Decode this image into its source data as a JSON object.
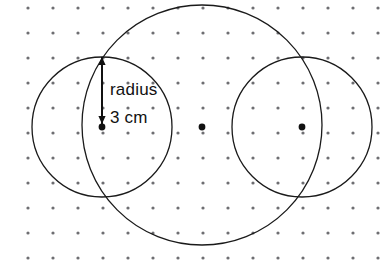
{
  "figure": {
    "background_color": "#ffffff",
    "width": 388,
    "height": 262,
    "annotations": {
      "radius_word": "radius",
      "radius_value": "3 cm"
    },
    "grid": {
      "dot_color": "#6e6e72",
      "dot_radius": 1.6,
      "spacing_x": 25,
      "spacing_y": 25,
      "origin_x": 28,
      "origin_y": 8,
      "cols": 15,
      "rows": 11
    },
    "stroke_color": "#1a1a1a",
    "center_dot_color": "#111111",
    "circles": [
      {
        "name": "large-circle",
        "cx": 202,
        "cy": 125,
        "r": 120,
        "has_center_dot": false
      },
      {
        "name": "left-circle",
        "cx": 102,
        "cy": 127,
        "r": 70,
        "has_center_dot": true
      },
      {
        "name": "right-circle",
        "cx": 302,
        "cy": 127,
        "r": 70,
        "has_center_dot": true
      }
    ],
    "center_dots": [
      {
        "name": "left-center-dot",
        "cx": 102,
        "cy": 127,
        "r": 3.4
      },
      {
        "name": "middle-center-dot",
        "cx": 202,
        "cy": 127,
        "r": 3.4
      },
      {
        "name": "right-center-dot",
        "cx": 302,
        "cy": 127,
        "r": 3.4
      }
    ],
    "radius_arrow": {
      "x": 102,
      "y_top": 57,
      "y_bottom": 124,
      "label_word_x": 110,
      "label_word_y": 95,
      "label_value_x": 110,
      "label_value_y": 123
    }
  },
  "chart_data": {
    "type": "diagram",
    "shapes": [
      {
        "shape": "circle",
        "label": "large-circle",
        "center": [
          202,
          125
        ],
        "radius_px": 120
      },
      {
        "shape": "circle",
        "label": "left-circle",
        "center": [
          102,
          127
        ],
        "radius_px": 70
      },
      {
        "shape": "circle",
        "label": "right-circle",
        "center": [
          302,
          127
        ],
        "radius_px": 70
      }
    ],
    "points": [
      {
        "label": "left-center",
        "xy": [
          102,
          127
        ]
      },
      {
        "label": "middle-center",
        "xy": [
          202,
          127
        ]
      },
      {
        "label": "right-center",
        "xy": [
          302,
          127
        ]
      }
    ],
    "annotations": [
      {
        "text": "radius",
        "xy": [
          110,
          95
        ]
      },
      {
        "text": "3 cm",
        "xy": [
          110,
          123
        ]
      }
    ],
    "grid": {
      "type": "dot-lattice",
      "spacing_px": 25,
      "cols": 15,
      "rows": 11
    }
  }
}
